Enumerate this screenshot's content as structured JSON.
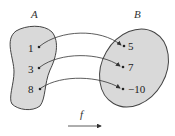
{
  "diagram": {
    "set_a": {
      "label": "A",
      "elements": [
        "1",
        "3",
        "8"
      ]
    },
    "set_b": {
      "label": "B",
      "elements": [
        "5",
        "7",
        "−10"
      ]
    },
    "function_label": "f",
    "mappings": [
      {
        "from": "1",
        "to": "5"
      },
      {
        "from": "3",
        "to": "7"
      },
      {
        "from": "8",
        "to": "−10"
      }
    ],
    "colors": {
      "fill": "#d9d9d9",
      "stroke": "#444444"
    }
  }
}
